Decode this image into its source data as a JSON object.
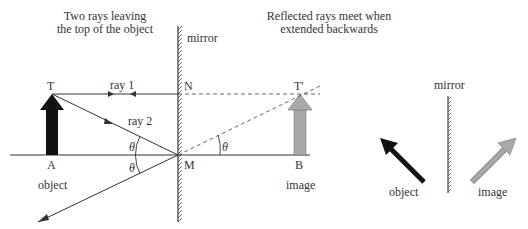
{
  "diagram": {
    "type": "plane-mirror-ray-diagram",
    "captions": {
      "left_line1": "Two rays leaving",
      "left_line2": "the top of the object",
      "right_line1": "Reflected rays meet when",
      "right_line2": "extended backwards"
    },
    "labels": {
      "mirror_main": "mirror",
      "mirror_small": "mirror",
      "T": "T",
      "T_prime": "T'",
      "N": "N",
      "M": "M",
      "A": "A",
      "B": "B",
      "ray1": "ray 1",
      "ray2": "ray 2",
      "theta": "θ",
      "object_main": "object",
      "image_main": "image",
      "object_small": "object",
      "image_small": "image"
    },
    "colors": {
      "line": "#333333",
      "object_arrow": "#111111",
      "image_arrow_fill": "#a9a9a9",
      "image_arrow_stroke": "#7a7a7a",
      "dashed": "#555555"
    }
  }
}
